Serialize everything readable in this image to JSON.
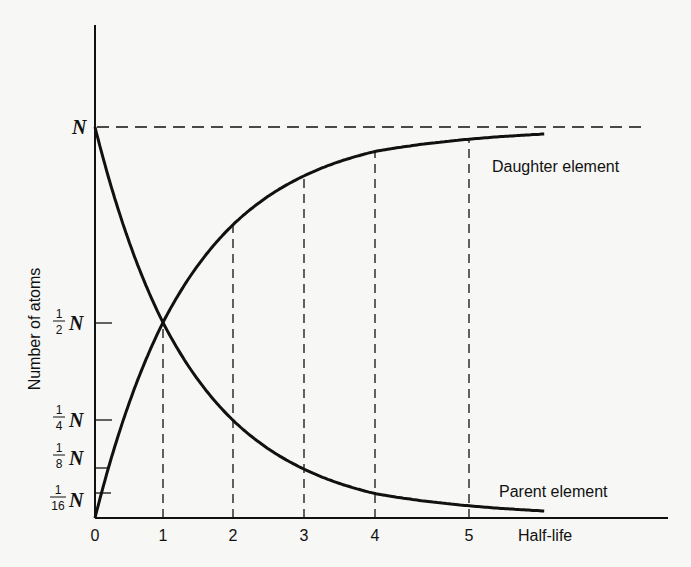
{
  "chart_data": {
    "type": "line",
    "title": "",
    "xlabel": "Half-life",
    "ylabel": "Number of atoms",
    "x_ticks": [
      "0",
      "1",
      "2",
      "3",
      "4",
      "5"
    ],
    "y_ticks": [
      {
        "num": "1",
        "den": "16",
        "sym": "N",
        "value": 0.0625
      },
      {
        "num": "1",
        "den": "8",
        "sym": "N",
        "value": 0.125
      },
      {
        "num": "1",
        "den": "4",
        "sym": "N",
        "value": 0.25
      },
      {
        "num": "1",
        "den": "2",
        "sym": "N",
        "value": 0.5
      },
      {
        "num": "",
        "den": "",
        "sym": "N",
        "value": 1.0
      }
    ],
    "series": [
      {
        "name": "Parent element",
        "x": [
          0,
          1,
          2,
          3,
          4,
          5,
          5.8
        ],
        "values": [
          1.0,
          0.5,
          0.25,
          0.125,
          0.0625,
          0.03125,
          0.018
        ]
      },
      {
        "name": "Daughter element",
        "x": [
          0,
          1,
          2,
          3,
          4,
          5,
          5.8
        ],
        "values": [
          0.0,
          0.5,
          0.75,
          0.875,
          0.9375,
          0.96875,
          0.982
        ]
      }
    ],
    "reference_line": {
      "label": "N",
      "value": 1.0,
      "style": "dashed"
    },
    "vertical_guides": [
      1,
      2,
      3,
      4,
      5
    ],
    "grid": false,
    "legend": "inline labels near curves",
    "ylim": [
      0,
      1.0
    ],
    "xlim": [
      0,
      6
    ]
  },
  "labels": {
    "y_axis": "Number of atoms",
    "x_axis": "Half-life",
    "daughter": "Daughter element",
    "parent": "Parent element",
    "n_top": "N"
  }
}
